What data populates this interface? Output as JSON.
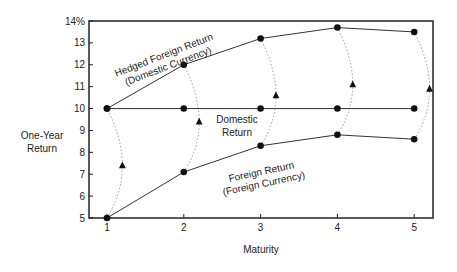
{
  "chart_data": {
    "type": "line",
    "title": "",
    "xlabel": "Maturity",
    "ylabel": "One-Year Return",
    "x": [
      1,
      2,
      3,
      4,
      5
    ],
    "xticks": [
      "1",
      "2",
      "3",
      "4",
      "5"
    ],
    "yticks": [
      "5",
      "6",
      "7",
      "8",
      "9",
      "10",
      "11",
      "12",
      "13",
      "14%"
    ],
    "xlim": [
      0.75,
      5.25
    ],
    "ylim": [
      5,
      14
    ],
    "grid": false,
    "legend": "none (inline annotations)",
    "series": [
      {
        "name": "Hedged Foreign Return (Domestic Currency)",
        "style": "solid line with circle markers",
        "values": [
          10,
          12,
          13.2,
          13.7,
          13.5
        ]
      },
      {
        "name": "Domestic Return",
        "style": "solid line with circle markers",
        "values": [
          10,
          10,
          10,
          10,
          10
        ]
      },
      {
        "name": "Foreign Return (Foreign Currency)",
        "style": "solid line with circle markers",
        "values": [
          5,
          7.1,
          8.3,
          8.8,
          8.6
        ]
      }
    ],
    "connectors": {
      "style": "dotted curved arcs linking foreign return (bottom) to hedged foreign return (top) at each maturity, with triangle markers",
      "triangles": [
        {
          "x": 1.2,
          "y": 7.4
        },
        {
          "x": 2.2,
          "y": 9.4
        },
        {
          "x": 3.2,
          "y": 10.6
        },
        {
          "x": 4.2,
          "y": 11.1
        },
        {
          "x": 5.2,
          "y": 10.9
        }
      ]
    },
    "annotations": [
      {
        "text": [
          "Hedged Foreign Return",
          "(Domestic Currency)"
        ],
        "near": "upper line, between maturity 1 and 2"
      },
      {
        "text": [
          "Domestic",
          "Return"
        ],
        "near": "flat line at 10, between maturity 2 and 3"
      },
      {
        "text": [
          "Foreign Return",
          "(Foreign Currency)"
        ],
        "near": "lower line, between maturity 3 and 4"
      }
    ]
  },
  "labels": {
    "ylabel_line1": "One-Year",
    "ylabel_line2": "Return",
    "xlabel": "Maturity",
    "hedged_line1": "Hedged Foreign Return",
    "hedged_line2": "(Domestic Currency)",
    "domestic_line1": "Domestic",
    "domestic_line2": "Return",
    "foreign_line1": "Foreign Return",
    "foreign_line2": "(Foreign Currency)"
  },
  "colors": {
    "line": "#333333",
    "frame": "#222222",
    "dotted": "#999999",
    "marker": "#111111"
  }
}
